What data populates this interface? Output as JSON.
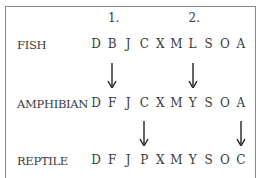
{
  "steps": [
    {
      "label": "1.",
      "column": 1
    },
    {
      "label": "2.",
      "column": 6
    }
  ],
  "rows": [
    {
      "label": "FISH",
      "letters": [
        "D",
        "B",
        "J",
        "C",
        "X",
        "M",
        "L",
        "S",
        "O",
        "A"
      ]
    },
    {
      "label": "AMPHIBIAN",
      "letters": [
        "D",
        "F",
        "J",
        "C",
        "X",
        "M",
        "Y",
        "S",
        "O",
        "A"
      ]
    },
    {
      "label": "REPTILE",
      "letters": [
        "D",
        "F",
        "J",
        "P",
        "X",
        "M",
        "Y",
        "S",
        "O",
        "C"
      ]
    }
  ],
  "arrows": [
    {
      "from_row": 0,
      "to_row": 1,
      "columns": [
        1,
        6
      ]
    },
    {
      "from_row": 1,
      "to_row": 2,
      "columns": [
        3,
        9
      ]
    }
  ],
  "icons": {
    "arrow": "down-arrow-icon"
  }
}
